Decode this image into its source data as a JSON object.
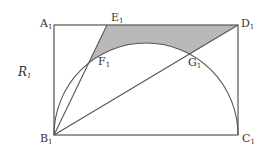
{
  "figure": {
    "label": "R",
    "label_sub": "1",
    "shade_color": "#b9b9b9",
    "stroke_color": "#555555",
    "rect": {
      "x1": 54,
      "y1": 25,
      "x2": 238,
      "y2": 135
    },
    "semicircle": {
      "cx": 146,
      "cy": 135,
      "r": 92
    },
    "E_x": 107,
    "points": [
      {
        "name": "A",
        "sub": "1",
        "x": 54,
        "y": 25
      },
      {
        "name": "E",
        "sub": "1",
        "x": 107,
        "y": 25
      },
      {
        "name": "D",
        "sub": "1",
        "x": 238,
        "y": 25
      },
      {
        "name": "F",
        "sub": "1",
        "x": 92,
        "y": 57
      },
      {
        "name": "G",
        "sub": "1",
        "x": 181,
        "y": 60
      },
      {
        "name": "B",
        "sub": "1",
        "x": 54,
        "y": 135
      },
      {
        "name": "C",
        "sub": "1",
        "x": 238,
        "y": 135
      }
    ]
  },
  "labels": {
    "A": "A",
    "E": "E",
    "D": "D",
    "F": "F",
    "G": "G",
    "B": "B",
    "C": "C",
    "R": "R",
    "sub": "1"
  }
}
